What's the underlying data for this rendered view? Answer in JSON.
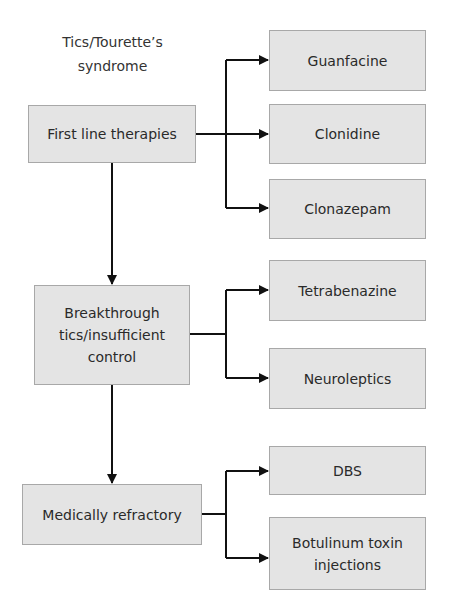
{
  "title": {
    "line1": "Tics/Tourette’s",
    "line2": "syndrome"
  },
  "stages": [
    {
      "label": "First line therapies",
      "treatments": [
        "Guanfacine",
        "Clonidine",
        "Clonazepam"
      ]
    },
    {
      "label_lines": [
        "Breakthrough",
        "tics/insufficient",
        "control"
      ],
      "treatments": [
        "Tetrabenazine",
        "Neuroleptics"
      ]
    },
    {
      "label": "Medically refractory",
      "treatments": [
        "DBS",
        {
          "line1": "Botulinum toxin",
          "line2": "injections"
        }
      ]
    }
  ],
  "colors": {
    "box_fill": "#e4e4e4",
    "box_border": "#a8a8a8",
    "line": "#111111",
    "text": "#2a2a2a"
  }
}
